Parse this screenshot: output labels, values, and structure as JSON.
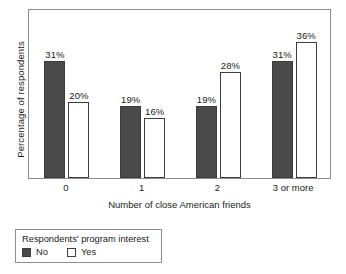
{
  "chart_data": {
    "type": "bar",
    "title": "",
    "subtitle": "",
    "xlabel": "Number of close American friends",
    "ylabel": "Percentage of respondents",
    "categories": [
      "0",
      "1",
      "2",
      "3 or more"
    ],
    "series": [
      {
        "name": "No",
        "values": [
          31,
          19,
          19,
          31
        ],
        "labels": [
          "31%",
          "19%",
          "19%",
          "31%"
        ],
        "color": "#4a4a4a",
        "style": "filled"
      },
      {
        "name": "Yes",
        "values": [
          20,
          16,
          28,
          36
        ],
        "labels": [
          "20%",
          "16%",
          "28%",
          "36%"
        ],
        "color": "#ffffff",
        "style": "outlined"
      }
    ],
    "ylim": [
      0,
      45
    ],
    "yticks": [],
    "ytick_labels": [],
    "grid": false,
    "value_label_suffix": "%",
    "legend_position": "below-plot-left",
    "legend_title": "Respondents' program interest",
    "axis_color": "#8d8d8d",
    "text_color": "#1a1a1a",
    "background": "#ffffff"
  },
  "legend": {
    "title": "Respondents' program interest",
    "entries": [
      {
        "label": "No",
        "swatch": "filled-dark-square"
      },
      {
        "label": "Yes",
        "swatch": "outlined-white-square"
      }
    ]
  }
}
